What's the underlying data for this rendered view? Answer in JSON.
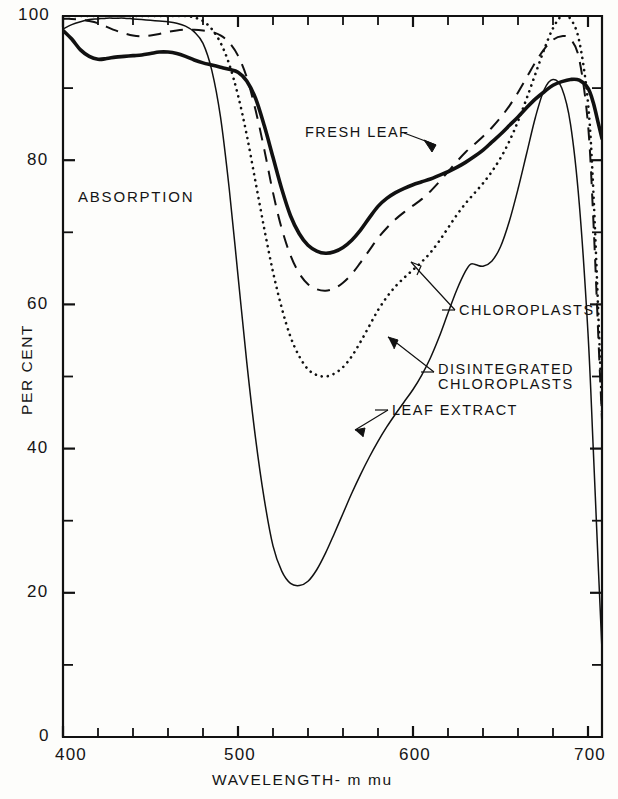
{
  "figure": {
    "background_color": "#fdfdfb",
    "ink_color": "#111111"
  },
  "axes": {
    "x_title": "WAVELENGTH- m mu",
    "y_title": "PER CENT",
    "x_ticks_major": [
      "400",
      "500",
      "600",
      "700"
    ],
    "y_ticks_major": [
      "0",
      "20",
      "40",
      "60",
      "80",
      "100"
    ]
  },
  "annotations": {
    "absorption": "ABSORPTION",
    "fresh_leaf": "FRESH LEAF",
    "chloroplasts": "CHLOROPLASTS",
    "disintegrated_line1": "DISINTEGRATED",
    "disintegrated_line2": "CHLOROPLASTS",
    "leaf_extract": "LEAF EXTRACT"
  },
  "chart_data": {
    "type": "line",
    "title": "",
    "subtitle": "",
    "xlabel": "WAVELENGTH- m mu",
    "ylabel": "PER CENT",
    "xlim": [
      400,
      708
    ],
    "ylim": [
      0,
      100
    ],
    "xticks": [
      400,
      500,
      600,
      700
    ],
    "xticks_minor": [
      420,
      440,
      460,
      480,
      520,
      540,
      560,
      580,
      620,
      640,
      660,
      680
    ],
    "yticks": [
      0,
      20,
      40,
      60,
      80,
      100
    ],
    "yticks_minor": [
      10,
      30,
      50,
      70,
      90
    ],
    "grid": false,
    "legend": "inline-annotations",
    "annotation_note": "ABSORPTION",
    "series": [
      {
        "name": "FRESH LEAF",
        "style": "solid-thick",
        "color": "#111111",
        "x": [
          400,
          405,
          410,
          415,
          420,
          425,
          430,
          435,
          440,
          445,
          450,
          455,
          460,
          465,
          470,
          475,
          480,
          485,
          490,
          495,
          500,
          505,
          510,
          515,
          520,
          525,
          530,
          535,
          540,
          545,
          550,
          555,
          560,
          565,
          570,
          575,
          580,
          585,
          590,
          595,
          600,
          605,
          610,
          615,
          620,
          625,
          630,
          635,
          640,
          645,
          650,
          655,
          660,
          665,
          670,
          675,
          680,
          685,
          690,
          695,
          700,
          703,
          706,
          708
        ],
        "y": [
          98.0,
          96.8,
          95.3,
          94.4,
          94.0,
          94.1,
          94.3,
          94.4,
          94.5,
          94.6,
          94.8,
          95.0,
          95.0,
          94.8,
          94.4,
          93.9,
          93.5,
          93.2,
          92.9,
          92.6,
          92.2,
          91.0,
          88.6,
          84.8,
          80.4,
          76.0,
          72.3,
          69.8,
          68.2,
          67.4,
          67.1,
          67.3,
          67.9,
          68.9,
          70.3,
          72.0,
          73.6,
          74.7,
          75.5,
          76.1,
          76.6,
          77.0,
          77.4,
          77.9,
          78.4,
          79.0,
          79.7,
          80.5,
          81.4,
          82.5,
          83.6,
          84.8,
          86.0,
          87.3,
          88.5,
          89.5,
          90.4,
          90.9,
          91.2,
          91.1,
          90.0,
          88.0,
          85.0,
          83.0
        ]
      },
      {
        "name": "CHLOROPLASTS",
        "style": "dashed",
        "color": "#111111",
        "x": [
          400,
          405,
          410,
          415,
          420,
          425,
          430,
          435,
          440,
          445,
          450,
          455,
          460,
          465,
          470,
          475,
          480,
          485,
          490,
          495,
          500,
          505,
          510,
          515,
          520,
          525,
          530,
          535,
          540,
          545,
          550,
          555,
          560,
          565,
          570,
          575,
          580,
          585,
          590,
          595,
          600,
          605,
          610,
          615,
          620,
          625,
          630,
          635,
          640,
          645,
          650,
          655,
          660,
          665,
          670,
          675,
          680,
          685,
          690,
          695,
          700,
          703,
          706,
          708
        ],
        "y": [
          99.6,
          99.6,
          99.5,
          99.3,
          99.0,
          98.5,
          98.0,
          97.6,
          97.3,
          97.2,
          97.3,
          97.5,
          97.8,
          98.0,
          98.1,
          98.1,
          98.0,
          97.8,
          97.3,
          96.3,
          94.5,
          91.5,
          87.0,
          81.5,
          75.5,
          70.5,
          66.8,
          64.3,
          62.8,
          62.1,
          61.9,
          62.2,
          63.0,
          64.2,
          65.8,
          67.5,
          69.2,
          70.6,
          71.8,
          72.8,
          73.7,
          74.6,
          75.7,
          77.0,
          78.4,
          79.8,
          81.1,
          82.2,
          83.3,
          84.5,
          85.9,
          87.5,
          89.4,
          91.5,
          93.6,
          95.4,
          96.7,
          97.2,
          96.8,
          94.0,
          85.0,
          72.0,
          55.0,
          44.0
        ]
      },
      {
        "name": "DISINTEGRATED CHLOROPLASTS",
        "style": "dotted",
        "color": "#111111",
        "x": [
          400,
          405,
          410,
          415,
          420,
          425,
          430,
          435,
          440,
          445,
          450,
          455,
          460,
          465,
          470,
          475,
          480,
          485,
          490,
          495,
          500,
          505,
          510,
          515,
          520,
          525,
          530,
          535,
          540,
          545,
          550,
          555,
          560,
          565,
          570,
          575,
          580,
          585,
          590,
          595,
          600,
          605,
          610,
          615,
          620,
          625,
          630,
          635,
          640,
          645,
          650,
          655,
          660,
          665,
          670,
          675,
          680,
          685,
          690,
          695,
          700,
          703,
          706,
          708
        ],
        "y": [
          100.0,
          100.0,
          100.0,
          100.0,
          100.0,
          100.0,
          100.0,
          100.0,
          100.0,
          100.0,
          100.0,
          100.0,
          100.0,
          100.0,
          100.0,
          99.8,
          99.3,
          98.2,
          96.3,
          93.3,
          89.0,
          83.5,
          77.0,
          70.5,
          64.5,
          59.5,
          55.5,
          52.8,
          51.0,
          50.2,
          50.0,
          50.4,
          51.3,
          52.8,
          54.8,
          57.0,
          59.2,
          61.0,
          62.5,
          63.7,
          64.8,
          65.9,
          67.2,
          68.8,
          70.6,
          72.4,
          74.0,
          75.4,
          76.8,
          78.4,
          80.3,
          82.6,
          85.4,
          88.6,
          92.0,
          95.4,
          98.3,
          100.0,
          99.6,
          96.5,
          88.0,
          76.0,
          58.0,
          45.0
        ]
      },
      {
        "name": "LEAF EXTRACT",
        "style": "solid-thin",
        "color": "#111111",
        "x": [
          400,
          405,
          410,
          415,
          420,
          425,
          430,
          435,
          440,
          445,
          450,
          455,
          460,
          465,
          470,
          475,
          480,
          485,
          490,
          495,
          500,
          505,
          510,
          515,
          520,
          525,
          530,
          535,
          540,
          545,
          550,
          555,
          560,
          565,
          570,
          575,
          580,
          585,
          590,
          595,
          600,
          605,
          610,
          615,
          620,
          625,
          630,
          633,
          636,
          640,
          645,
          650,
          655,
          660,
          665,
          670,
          675,
          680,
          685,
          690,
          695,
          700,
          703,
          706,
          708
        ],
        "y": [
          98.2,
          98.8,
          99.2,
          99.5,
          99.6,
          99.7,
          99.7,
          99.7,
          99.6,
          99.5,
          99.4,
          99.3,
          99.2,
          99.0,
          98.6,
          97.8,
          96.2,
          92.5,
          86.0,
          76.0,
          64.0,
          52.0,
          41.5,
          33.0,
          26.5,
          23.0,
          21.3,
          21.0,
          21.6,
          23.2,
          25.5,
          28.2,
          31.0,
          33.8,
          36.4,
          38.8,
          41.0,
          43.0,
          44.8,
          46.5,
          48.2,
          50.2,
          52.6,
          55.5,
          58.8,
          62.0,
          64.6,
          65.6,
          65.5,
          65.3,
          66.0,
          68.0,
          71.5,
          76.0,
          81.0,
          86.0,
          89.8,
          91.2,
          90.0,
          85.0,
          74.0,
          56.0,
          40.0,
          23.0,
          12.0
        ]
      }
    ]
  }
}
